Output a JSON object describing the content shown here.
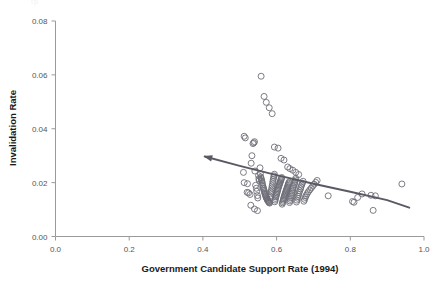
{
  "figure": {
    "background_color": "#ffffff",
    "top_artifact_text": "tp",
    "point_color": "#6e6e78",
    "trend_color": "#5a5a64",
    "axis_color": "#9a9a9a",
    "tick_label_color": "#555555",
    "axis_title_color": "#1a1a1a"
  },
  "chart_data": {
    "type": "scatter",
    "title": "",
    "xlabel": "Government Candidate Support Rate (1994)",
    "ylabel": "Invalidation Rate",
    "xlim": [
      0.0,
      1.0
    ],
    "ylim": [
      0.0,
      0.08
    ],
    "xticks": [
      0.0,
      0.2,
      0.4,
      0.6,
      0.8,
      1.0
    ],
    "xtick_labels": [
      "0.0",
      "0.2",
      "0.4",
      "0.6",
      "0.8",
      "1.0"
    ],
    "yticks": [
      0.0,
      0.02,
      0.04,
      0.06,
      0.08
    ],
    "ytick_labels": [
      "0.00",
      "0.02",
      "0.04",
      "0.06",
      "0.08"
    ],
    "grid": false,
    "legend": null,
    "marker": "open-circle",
    "marker_size": 3.0,
    "trend_line": {
      "style": "solid",
      "arrow_head": "left",
      "x": [
        0.405,
        0.5,
        0.6,
        0.7,
        0.8,
        0.9,
        0.96
      ],
      "y": [
        0.0297,
        0.0262,
        0.0228,
        0.0196,
        0.0166,
        0.0135,
        0.0107
      ]
    },
    "x": [
      0.51,
      0.512,
      0.515,
      0.521,
      0.524,
      0.528,
      0.531,
      0.533,
      0.536,
      0.538,
      0.54,
      0.541,
      0.543,
      0.545,
      0.546,
      0.548,
      0.549,
      0.551,
      0.552,
      0.553,
      0.555,
      0.556,
      0.557,
      0.558,
      0.559,
      0.56,
      0.561,
      0.562,
      0.563,
      0.564,
      0.565,
      0.566,
      0.567,
      0.568,
      0.569,
      0.57,
      0.571,
      0.572,
      0.573,
      0.574,
      0.575,
      0.576,
      0.577,
      0.578,
      0.579,
      0.58,
      0.581,
      0.582,
      0.583,
      0.584,
      0.585,
      0.586,
      0.587,
      0.588,
      0.589,
      0.59,
      0.591,
      0.592,
      0.593,
      0.594,
      0.595,
      0.596,
      0.597,
      0.598,
      0.599,
      0.6,
      0.601,
      0.602,
      0.603,
      0.604,
      0.605,
      0.606,
      0.607,
      0.608,
      0.609,
      0.61,
      0.611,
      0.612,
      0.613,
      0.614,
      0.615,
      0.616,
      0.617,
      0.618,
      0.619,
      0.62,
      0.621,
      0.622,
      0.623,
      0.624,
      0.625,
      0.626,
      0.627,
      0.628,
      0.629,
      0.63,
      0.631,
      0.632,
      0.633,
      0.634,
      0.635,
      0.636,
      0.637,
      0.638,
      0.64,
      0.641,
      0.642,
      0.643,
      0.644,
      0.645,
      0.646,
      0.648,
      0.649,
      0.65,
      0.651,
      0.652,
      0.654,
      0.655,
      0.657,
      0.658,
      0.66,
      0.661,
      0.663,
      0.665,
      0.666,
      0.668,
      0.67,
      0.672,
      0.674,
      0.676,
      0.678,
      0.68,
      0.683,
      0.686,
      0.69,
      0.694,
      0.698,
      0.702,
      0.706,
      0.71,
      0.74,
      0.806,
      0.81,
      0.82,
      0.832,
      0.856,
      0.862,
      0.868,
      0.94,
      0.558,
      0.566,
      0.572,
      0.58,
      0.588,
      0.594,
      0.604,
      0.612,
      0.62,
      0.63,
      0.636,
      0.644,
      0.652,
      0.66,
      0.512,
      0.52,
      0.53,
      0.54,
      0.548
    ],
    "y": [
      0.0238,
      0.0372,
      0.0366,
      0.0196,
      0.0162,
      0.0156,
      0.0272,
      0.03,
      0.0345,
      0.0348,
      0.0352,
      0.0243,
      0.019,
      0.0179,
      0.0168,
      0.0152,
      0.0143,
      0.0226,
      0.0214,
      0.0208,
      0.0255,
      0.0233,
      0.0221,
      0.0216,
      0.021,
      0.0205,
      0.0199,
      0.0192,
      0.0186,
      0.018,
      0.0176,
      0.0171,
      0.0166,
      0.0161,
      0.0157,
      0.0153,
      0.0149,
      0.0145,
      0.0142,
      0.0139,
      0.0136,
      0.0134,
      0.0132,
      0.013,
      0.0128,
      0.0126,
      0.0124,
      0.0144,
      0.015,
      0.0158,
      0.0165,
      0.0172,
      0.018,
      0.0188,
      0.0196,
      0.0204,
      0.0212,
      0.0219,
      0.0225,
      0.0231,
      0.0129,
      0.0135,
      0.0141,
      0.0147,
      0.0152,
      0.0157,
      0.0162,
      0.0167,
      0.0172,
      0.0177,
      0.0182,
      0.0187,
      0.0191,
      0.0195,
      0.0199,
      0.0203,
      0.0207,
      0.0211,
      0.0215,
      0.0219,
      0.012,
      0.0125,
      0.013,
      0.0135,
      0.014,
      0.0145,
      0.015,
      0.0154,
      0.0158,
      0.0162,
      0.0166,
      0.017,
      0.0174,
      0.0178,
      0.0182,
      0.0186,
      0.019,
      0.0194,
      0.0198,
      0.0202,
      0.0126,
      0.0132,
      0.0138,
      0.0144,
      0.015,
      0.0156,
      0.0162,
      0.0168,
      0.0174,
      0.018,
      0.0186,
      0.0192,
      0.0198,
      0.0204,
      0.021,
      0.0216,
      0.0128,
      0.0135,
      0.0142,
      0.0149,
      0.0156,
      0.0163,
      0.017,
      0.0177,
      0.0184,
      0.0191,
      0.0198,
      0.0205,
      0.0131,
      0.0138,
      0.0145,
      0.0152,
      0.0159,
      0.0166,
      0.0173,
      0.018,
      0.0187,
      0.0194,
      0.0201,
      0.0208,
      0.0151,
      0.013,
      0.0127,
      0.0145,
      0.0158,
      0.0153,
      0.0097,
      0.0151,
      0.0195,
      0.0595,
      0.052,
      0.0498,
      0.0478,
      0.0456,
      0.0332,
      0.0328,
      0.029,
      0.0284,
      0.0258,
      0.0252,
      0.0246,
      0.0238,
      0.023,
      0.02,
      0.0164,
      0.0116,
      0.0102,
      0.0096
    ]
  }
}
